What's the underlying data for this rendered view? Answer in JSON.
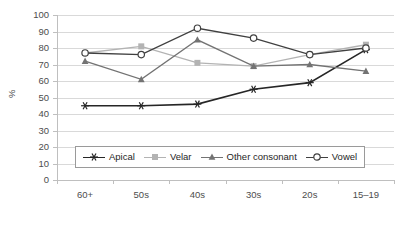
{
  "chart_data": {
    "type": "line",
    "title": "",
    "xlabel": "",
    "ylabel": "%",
    "categories": [
      "60+",
      "50s",
      "40s",
      "30s",
      "20s",
      "15–19"
    ],
    "ylim": [
      0,
      100
    ],
    "yticks": [
      0,
      10,
      20,
      30,
      40,
      50,
      60,
      70,
      80,
      90,
      100
    ],
    "grid": true,
    "legend_position": "inside-bottom-left",
    "series": [
      {
        "name": "Apical",
        "marker": "asterisk",
        "color": "#262626",
        "values": [
          45,
          45,
          46,
          55,
          59,
          79
        ]
      },
      {
        "name": "Velar",
        "marker": "square",
        "color": "#b3b3b3",
        "values": [
          77,
          81,
          71,
          69,
          76,
          82
        ]
      },
      {
        "name": "Other consonant",
        "marker": "triangle",
        "color": "#737373",
        "values": [
          72,
          61,
          85,
          69,
          70,
          66
        ]
      },
      {
        "name": "Vowel",
        "marker": "circle-open",
        "color": "#404040",
        "values": [
          77,
          76,
          92,
          86,
          76,
          80
        ]
      }
    ]
  },
  "axis": {
    "y_tick_labels": [
      "100",
      "90",
      "80",
      "70",
      "60",
      "50",
      "40",
      "30",
      "20",
      "10",
      "0"
    ],
    "y_title": "%",
    "x_tick_labels": [
      "60+",
      "50s",
      "40s",
      "30s",
      "20s",
      "15–19"
    ]
  },
  "legend": {
    "items": [
      {
        "label": "Apical"
      },
      {
        "label": "Velar"
      },
      {
        "label": "Other consonant"
      },
      {
        "label": "Vowel"
      }
    ]
  }
}
